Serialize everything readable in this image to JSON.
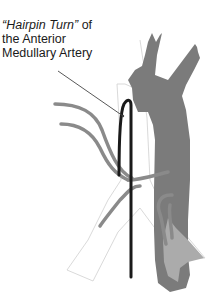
{
  "label": {
    "line1_italic": "“Hairpin Turn”",
    "line1_rest": " of",
    "line2": "the Anterior",
    "line3": "Medullary Artery"
  },
  "colors": {
    "aorta": "#7a7a7a",
    "aorta_light": "#a9a9a9",
    "branch_arteries": "#8a8a8a",
    "hairpin_artery": "#1a1a1a",
    "vertebra_outline": "#c8c8c8",
    "leader_line": "#444444"
  }
}
